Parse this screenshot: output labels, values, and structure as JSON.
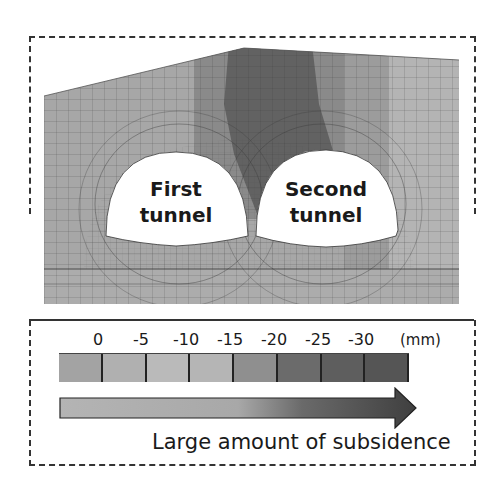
{
  "diagram": {
    "tunnels": [
      {
        "line1": "First",
        "line2": "tunnel"
      },
      {
        "line1": "Second",
        "line2": "tunnel"
      }
    ],
    "legend": {
      "ticks": [
        "0",
        "-5",
        "-10",
        "-15",
        "-20",
        "-25",
        "-30"
      ],
      "unit": "(mm)",
      "swatch_colors": [
        "#a3a3a3",
        "#b0b0b0",
        "#bababa",
        "#b5b5b5",
        "#8f8f8f",
        "#6b6b6b",
        "#5e5e5e",
        "#555555"
      ]
    },
    "arrow": {
      "caption": "Large amount of subsidence",
      "gradient_start": "#b4b4b4",
      "gradient_mid": "#a8a8a8",
      "gradient_end": "#3f3f3f"
    },
    "colors": {
      "mesh_left": "#a7a7a7",
      "mesh_dark": "#5f5f5f",
      "mesh_mid": "#808080",
      "mesh_right": "#b4b4b4",
      "mesh_bottom": "#acacac",
      "mesh_lines": "#404040"
    }
  }
}
